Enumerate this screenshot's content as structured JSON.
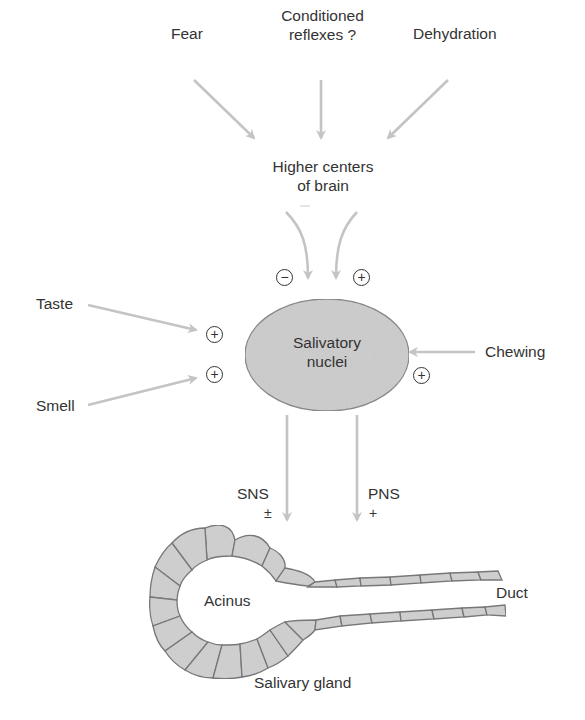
{
  "diagram": {
    "type": "flow",
    "inputs_top": {
      "fear": "Fear",
      "conditioned_line1": "Conditioned",
      "conditioned_line2": "reflexes ?",
      "dehydration": "Dehydration"
    },
    "higher_centers": {
      "line1": "Higher centers",
      "line2": "of brain"
    },
    "brain_signs": {
      "inhibitory": "−",
      "excitatory": "+"
    },
    "inputs_side": {
      "taste": "Taste",
      "smell": "Smell",
      "chewing": "Chewing",
      "taste_sign": "+",
      "smell_sign": "+",
      "chewing_sign": "+"
    },
    "nucleus": {
      "line1": "Salivatory",
      "line2": "nuclei"
    },
    "outputs": {
      "sns": "SNS",
      "sns_sign": "±",
      "pns": "PNS",
      "pns_sign": "+"
    },
    "gland": {
      "acinus": "Acinus",
      "duct": "Duct",
      "caption": "Salivary gland"
    },
    "colors": {
      "arrow": "#c4c4c4",
      "nucleus_fill": "#cfcfcf",
      "cell_fill": "#d2d2d2",
      "cell_stroke": "#7a7a7a",
      "text": "#333333"
    }
  }
}
